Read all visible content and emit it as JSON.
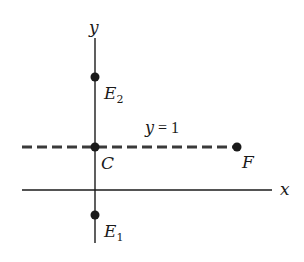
{
  "diagram": {
    "axes": {
      "x_label": "x",
      "y_label": "y"
    },
    "line": {
      "equation_var": "y",
      "equation_rest": " = 1",
      "style": "dashed"
    },
    "points": {
      "E2": {
        "letter": "E",
        "sub": "2"
      },
      "C": {
        "letter": "C"
      },
      "F": {
        "letter": "F"
      },
      "E1": {
        "letter": "E",
        "sub": "1"
      }
    },
    "colors": {
      "ink": "#1a1a1a",
      "dashed": "#3a3a3a",
      "background": "#ffffff"
    }
  }
}
